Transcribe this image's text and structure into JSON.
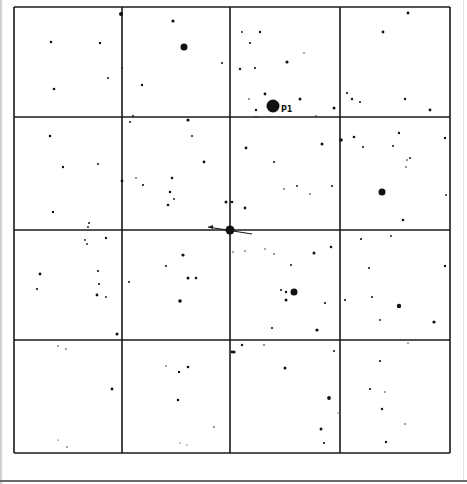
{
  "finder_chart": {
    "frame": {
      "x0": 14,
      "y0": 7,
      "x1": 450,
      "y1": 453
    },
    "grid": {
      "vertical_lines": [
        14,
        122,
        230,
        340,
        450
      ],
      "horizontal_lines": [
        7,
        117,
        230,
        340,
        453
      ],
      "rows": 4,
      "cols": 4
    },
    "line_color": "#1a1a1a",
    "star_color": "#111111",
    "target_marker": {
      "x": 230,
      "y": 230,
      "r": 4.5,
      "pointer_from": [
        208,
        227
      ],
      "pointer_to": [
        252,
        234
      ]
    },
    "labeled_star": {
      "label": "P1",
      "x": 273,
      "y": 106,
      "r": 6.5,
      "label_x": 281,
      "label_y": 112
    },
    "stars": [
      [
        121,
        14,
        2
      ],
      [
        173,
        21,
        1.6
      ],
      [
        184,
        47,
        3.5
      ],
      [
        222,
        63,
        1
      ],
      [
        142,
        85,
        1.2
      ],
      [
        51,
        42,
        1.3
      ],
      [
        100,
        43,
        1.2
      ],
      [
        108,
        78,
        1
      ],
      [
        54,
        89,
        1.3
      ],
      [
        122,
        68,
        0.8
      ],
      [
        133,
        116,
        1
      ],
      [
        130,
        122,
        1
      ],
      [
        188,
        120,
        1.6
      ],
      [
        192,
        136,
        1
      ],
      [
        50,
        136,
        1.3
      ],
      [
        63,
        167,
        1.2
      ],
      [
        98,
        164,
        1
      ],
      [
        204,
        162,
        1.4
      ],
      [
        122,
        181,
        1.4
      ],
      [
        136,
        178,
        0.8
      ],
      [
        143,
        185,
        1.1
      ],
      [
        172,
        178,
        1.3
      ],
      [
        170,
        192,
        1.3
      ],
      [
        174,
        199,
        0.9
      ],
      [
        168,
        205,
        1.3
      ],
      [
        53,
        212,
        1.2
      ],
      [
        89,
        223,
        1
      ],
      [
        88,
        227,
        0.9
      ],
      [
        226,
        202,
        1.5
      ],
      [
        242,
        32,
        0.9
      ],
      [
        260,
        32,
        1.2
      ],
      [
        250,
        43,
        1.1
      ],
      [
        240,
        69,
        1.2
      ],
      [
        255,
        68,
        1.1
      ],
      [
        287,
        62,
        1.6
      ],
      [
        304,
        53,
        0.7
      ],
      [
        265,
        94,
        1.4
      ],
      [
        249,
        99,
        0.8
      ],
      [
        256,
        110,
        1.2
      ],
      [
        300,
        99,
        1.5
      ],
      [
        334,
        108,
        1.5
      ],
      [
        316,
        116,
        0.8
      ],
      [
        256,
        117,
        0.7
      ],
      [
        408,
        13,
        1.4
      ],
      [
        383,
        32,
        1.4
      ],
      [
        347,
        93,
        1.1
      ],
      [
        352,
        99,
        1.2
      ],
      [
        360,
        102,
        1
      ],
      [
        405,
        99,
        1.2
      ],
      [
        430,
        110,
        1.4
      ],
      [
        246,
        148,
        1.4
      ],
      [
        322,
        144,
        1.5
      ],
      [
        274,
        162,
        1.1
      ],
      [
        284,
        189,
        0.8
      ],
      [
        297,
        186,
        0.9
      ],
      [
        310,
        194,
        0.8
      ],
      [
        332,
        186,
        1.1
      ],
      [
        232,
        202,
        1.3
      ],
      [
        245,
        208,
        1.4
      ],
      [
        341,
        140,
        1.8
      ],
      [
        354,
        137,
        1.3
      ],
      [
        363,
        147,
        1
      ],
      [
        399,
        133,
        1.2
      ],
      [
        393,
        146,
        1
      ],
      [
        410,
        158,
        1
      ],
      [
        407,
        160,
        0.8
      ],
      [
        406,
        167,
        0.8
      ],
      [
        382,
        192,
        3.5
      ],
      [
        445,
        138,
        1.2
      ],
      [
        446,
        195,
        0.9
      ],
      [
        403,
        220,
        1.3
      ],
      [
        85,
        240,
        0.9
      ],
      [
        87,
        244,
        0.9
      ],
      [
        106,
        238,
        1.2
      ],
      [
        40,
        274,
        1.4
      ],
      [
        37,
        289,
        1.1
      ],
      [
        98,
        271,
        1.1
      ],
      [
        99,
        284,
        1.1
      ],
      [
        97,
        295,
        1.4
      ],
      [
        106,
        297,
        0.9
      ],
      [
        117,
        334,
        1.5
      ],
      [
        129,
        282,
        1
      ],
      [
        183,
        255,
        1.6
      ],
      [
        166,
        266,
        1.1
      ],
      [
        188,
        278,
        1.5
      ],
      [
        196,
        278,
        1.3
      ],
      [
        180,
        301,
        1.8
      ],
      [
        232,
        352,
        1.4
      ],
      [
        233,
        252,
        0.7
      ],
      [
        245,
        251,
        0.7
      ],
      [
        265,
        249,
        0.7
      ],
      [
        274,
        254,
        0.8
      ],
      [
        314,
        253,
        1.5
      ],
      [
        331,
        247,
        1.3
      ],
      [
        291,
        265,
        1
      ],
      [
        281,
        290,
        1.1
      ],
      [
        286,
        292,
        1.2
      ],
      [
        294,
        292,
        3.5
      ],
      [
        286,
        300,
        1.5
      ],
      [
        325,
        303,
        1.1
      ],
      [
        272,
        328,
        1.1
      ],
      [
        317,
        330,
        1.6
      ],
      [
        361,
        239,
        1.1
      ],
      [
        391,
        236,
        0.9
      ],
      [
        369,
        268,
        1
      ],
      [
        445,
        266,
        1.2
      ],
      [
        345,
        300,
        1.1
      ],
      [
        372,
        297,
        1
      ],
      [
        399,
        306,
        2.2
      ],
      [
        380,
        320,
        0.9
      ],
      [
        434,
        322,
        1.6
      ],
      [
        234,
        352,
        1.6
      ],
      [
        242,
        345,
        1.2
      ],
      [
        264,
        345,
        0.8
      ],
      [
        334,
        351,
        1
      ],
      [
        285,
        368,
        1.5
      ],
      [
        329,
        398,
        1.9
      ],
      [
        321,
        429,
        1.5
      ],
      [
        324,
        443,
        1.1
      ],
      [
        338,
        413,
        0.6
      ],
      [
        408,
        343,
        0.7
      ],
      [
        380,
        361,
        1.1
      ],
      [
        370,
        389,
        1.1
      ],
      [
        385,
        392,
        0.7
      ],
      [
        382,
        409,
        1.2
      ],
      [
        405,
        424,
        0.8
      ],
      [
        386,
        442,
        1.2
      ],
      [
        58,
        346,
        0.7
      ],
      [
        66,
        349,
        0.7
      ],
      [
        112,
        389,
        1.4
      ],
      [
        166,
        366,
        0.7
      ],
      [
        179,
        372,
        1.2
      ],
      [
        188,
        367,
        1.3
      ],
      [
        178,
        400,
        1.3
      ],
      [
        214,
        427,
        0.8
      ],
      [
        180,
        443,
        0.6
      ],
      [
        187,
        445,
        0.6
      ],
      [
        58,
        440,
        0.6
      ],
      [
        67,
        447,
        0.7
      ]
    ]
  }
}
